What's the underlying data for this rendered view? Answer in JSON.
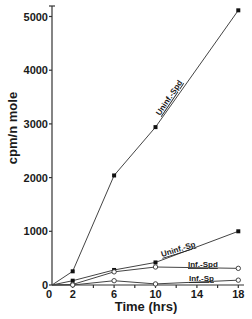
{
  "chart_data": {
    "type": "line",
    "title": "",
    "xlabel": "Time  (hrs)",
    "ylabel": "cpm/n mole",
    "xlim": [
      0,
      18
    ],
    "ylim": [
      0,
      5000
    ],
    "x_ticks": [
      0,
      2,
      6,
      10,
      14,
      18
    ],
    "x_minor_ticks": [
      2,
      4,
      6,
      8,
      10,
      12,
      14,
      16,
      18
    ],
    "y_ticks": [
      0,
      1000,
      2000,
      3000,
      4000,
      5000
    ],
    "grid": false,
    "legend": "inline labels on lines",
    "x": [
      0,
      2,
      6,
      10,
      18
    ],
    "series": [
      {
        "name": "Uninf.-Spd",
        "marker": "filled",
        "values": [
          0,
          255,
          2040,
          2940,
          5115
        ]
      },
      {
        "name": "Uninf.-Sp",
        "marker": "filled",
        "values": [
          0,
          80,
          280,
          420,
          1000
        ]
      },
      {
        "name": "Inf.-Spd",
        "marker": "open",
        "values": [
          0,
          10,
          245,
          335,
          310
        ]
      },
      {
        "name": "Inf.-Sp",
        "marker": "open",
        "values": [
          0,
          0,
          80,
          20,
          90
        ]
      }
    ]
  },
  "labels": {
    "x_axis_title": "Time  (hrs)",
    "y_axis_title": "cpm/n mole",
    "y_tick_labels": [
      "0",
      "1000",
      "2000",
      "3000",
      "4000",
      "5000"
    ],
    "x_tick_labels": [
      "0",
      "2",
      "6",
      "10",
      "14",
      "18"
    ],
    "series_labels": [
      "Uninf.-Spd",
      "Uninf.-Sp",
      "Inf.-Spd",
      "Inf.-Sp"
    ]
  }
}
